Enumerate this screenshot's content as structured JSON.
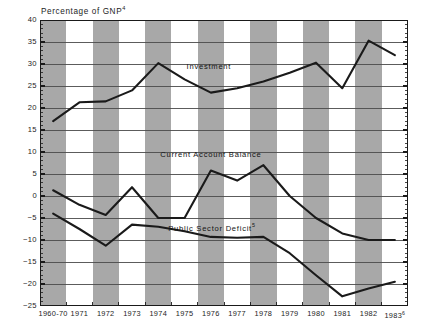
{
  "chart_data": {
    "type": "line",
    "title": "Percentage of GNP",
    "title_superscript": "4",
    "xlabel": "",
    "ylabel": "Percentage of GNP",
    "ylim": [
      -25,
      40
    ],
    "ytick_step": 5,
    "grid": true,
    "legend_position": "inline",
    "background_bands": "alternating vertical gray and white columns per year",
    "categories": [
      "1960-70",
      "1971",
      "1972",
      "1973",
      "1974",
      "1975",
      "1976",
      "1977",
      "1978",
      "1979",
      "1980",
      "1981",
      "1982",
      "1983"
    ],
    "last_category_superscript": "6",
    "yticks": [
      40,
      35,
      30,
      25,
      20,
      15,
      10,
      5,
      0,
      -5,
      -10,
      -15,
      -20,
      -25
    ],
    "series": [
      {
        "name": "Investment",
        "label_x_category_index": 6,
        "values": [
          17.0,
          21.3,
          21.5,
          24.0,
          30.2,
          26.5,
          23.5,
          24.5,
          26.0,
          28.0,
          30.3,
          24.5,
          35.3,
          32.0
        ]
      },
      {
        "name": "Current Account Balance",
        "label_superscript": "",
        "values": [
          1.3,
          -2.0,
          -4.3,
          2.0,
          -5.0,
          -5.0,
          5.8,
          3.5,
          7.0,
          0.0,
          -5.0,
          -8.5,
          -10.0,
          -10.0
        ]
      },
      {
        "name": "Public Sector Deficit",
        "label_superscript": "5",
        "values": [
          -4.0,
          -7.5,
          -11.3,
          -6.5,
          -7.0,
          -8.0,
          -9.3,
          -9.5,
          -9.3,
          -13.0,
          -18.0,
          -22.8,
          -21.0,
          -19.5
        ]
      }
    ]
  },
  "style": {
    "band_color": "#a8a8a8",
    "plot_bg": "#ffffff",
    "line_color": "#1a1a1a",
    "grid_color": "#4a4a4a",
    "axis_color": "#1a1a1a",
    "text_color": "#1d1d1d"
  }
}
